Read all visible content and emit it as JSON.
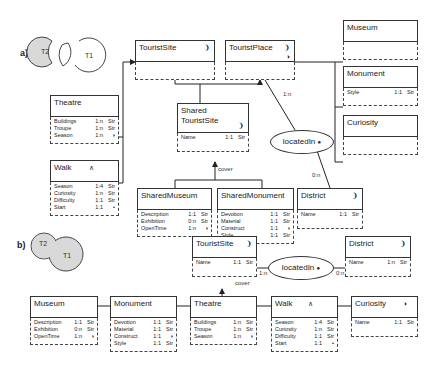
{
  "part_a": {
    "label": "a)",
    "venn": {
      "t2": "T2",
      "t1": "T1"
    },
    "entities": {
      "tourist_site": {
        "name": "TouristSite",
        "icon": "❩",
        "attrs": []
      },
      "tourist_place": {
        "name": "TouristPlace",
        "icon": "❩",
        "icon2": "◑",
        "attrs": []
      },
      "museum": {
        "name": "Museum",
        "attrs": []
      },
      "monument": {
        "name": "Monument",
        "attrs": [
          {
            "name": "Style",
            "card": "1:1",
            "type": "Str"
          }
        ]
      },
      "curiosity": {
        "name": "Curiosity",
        "attrs": []
      },
      "theatre": {
        "name": "Theatre",
        "attrs": [
          {
            "name": "Buildings",
            "card": "1:n",
            "type": "Str"
          },
          {
            "name": "Troupe",
            "card": "1:n",
            "type": "Str"
          },
          {
            "name": "Season",
            "card": "1:n",
            "type": "◑"
          }
        ]
      },
      "shared_tourist_site": {
        "name1": "Shared",
        "name2": "TouristSite",
        "icon": "❩",
        "attrs": [
          {
            "name": "Name",
            "card": "1:1",
            "type": "Str"
          }
        ]
      },
      "walk": {
        "name": "Walk",
        "icon": "∧",
        "attrs": [
          {
            "name": "Season",
            "card": "1:4",
            "type": "Str"
          },
          {
            "name": "Curiosity",
            "card": "1:n",
            "type": "Str"
          },
          {
            "name": "Difficulty",
            "card": "1:1",
            "type": "Str"
          },
          {
            "name": "Start",
            "card": "1:1",
            "type": "•"
          }
        ]
      },
      "shared_museum": {
        "name": "SharedMuseum",
        "attrs": [
          {
            "name": "Description",
            "card": "1:1",
            "type": "Str"
          },
          {
            "name": "Exhibition",
            "card": "0:n",
            "type": "Str"
          },
          {
            "name": "OpenTime",
            "card": "1:n",
            "type": "◑"
          }
        ]
      },
      "shared_monument": {
        "name": "SharedMonument",
        "attrs": [
          {
            "name": "Devotion",
            "card": "1:1",
            "type": "Str"
          },
          {
            "name": "Material",
            "card": "1:1",
            "type": "Str"
          },
          {
            "name": "Construct",
            "card": "1:1",
            "type": "◑"
          },
          {
            "name": "Style",
            "card": "1:1",
            "type": "Str"
          }
        ]
      },
      "district": {
        "name": "District",
        "icon": "❩",
        "attrs": [
          {
            "name": "Name",
            "card": "1:1",
            "type": "Str"
          }
        ]
      }
    },
    "relationship": {
      "name": "locatedIn",
      "icon": "●",
      "card_left": "1:n",
      "card_right": "0:n"
    },
    "cover_label": "cover"
  },
  "part_b": {
    "label": "b)",
    "venn": {
      "t2": "T2",
      "t1": "T1"
    },
    "entities": {
      "tourist_site": {
        "name": "TouristSite",
        "icon": "❩",
        "attrs": [
          {
            "name": "Name",
            "card": "1:1",
            "type": "Str"
          }
        ]
      },
      "district": {
        "name": "District",
        "icon": "❩",
        "attrs": [
          {
            "name": "Name",
            "card": "1:n",
            "type": "Str"
          }
        ]
      },
      "museum": {
        "name": "Museum",
        "attrs": [
          {
            "name": "Description",
            "card": "1:1",
            "type": "Str"
          },
          {
            "name": "Exhibition",
            "card": "0:n",
            "type": "Str"
          },
          {
            "name": "OpenTime",
            "card": "1:n",
            "type": "◑"
          }
        ]
      },
      "monument": {
        "name": "Monument",
        "attrs": [
          {
            "name": "Devotion",
            "card": "1:1",
            "type": "Str"
          },
          {
            "name": "Material",
            "card": "1:1",
            "type": "Str"
          },
          {
            "name": "Construct",
            "card": "1:1",
            "type": "◑"
          },
          {
            "name": "Style",
            "card": "1:1",
            "type": "Str"
          }
        ]
      },
      "theatre": {
        "name": "Theatre",
        "attrs": [
          {
            "name": "Buildings",
            "card": "1:n",
            "type": "Str"
          },
          {
            "name": "Troupe",
            "card": "1:n",
            "type": "Str"
          },
          {
            "name": "Season",
            "card": "1:n",
            "type": "◑"
          }
        ]
      },
      "walk": {
        "name": "Walk",
        "icon": "∧",
        "attrs": [
          {
            "name": "Season",
            "card": "1:4",
            "type": "Str"
          },
          {
            "name": "Curiosity",
            "card": "1:n",
            "type": "Str"
          },
          {
            "name": "Difficulty",
            "card": "1:1",
            "type": "Str"
          },
          {
            "name": "Start",
            "card": "1:1",
            "type": "•"
          }
        ]
      },
      "curiosity": {
        "name": "Curiosity",
        "icon": "◑",
        "attrs": [
          {
            "name": "Name",
            "card": "1:1",
            "type": "Str"
          }
        ]
      }
    },
    "relationship": {
      "name": "locatedIn",
      "icon": "●",
      "card_left": "1:n",
      "card_right": "0:n"
    },
    "cover_label": "cover"
  }
}
